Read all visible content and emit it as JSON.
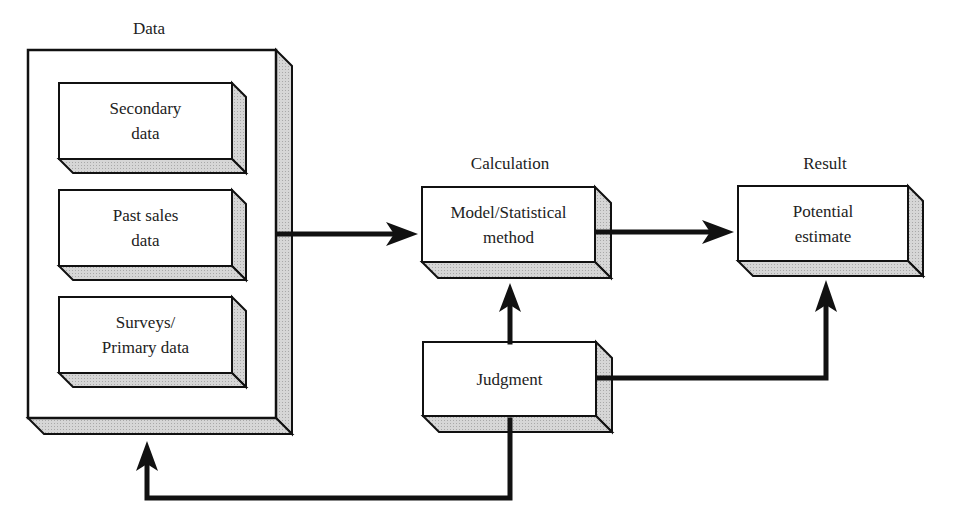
{
  "caption_fragment": "g",
  "colors": {
    "line": "#111111",
    "box_fill": "#ffffff",
    "shade": "#cfcfcf"
  },
  "diagram": {
    "data_group": {
      "label": "Data",
      "items": [
        {
          "text": "Secondary\ndata"
        },
        {
          "text": "Past sales\ndata"
        },
        {
          "text": "Surveys/\nPrimary data"
        }
      ]
    },
    "calculation": {
      "label": "Calculation",
      "box_text": "Model/Statistical\nmethod"
    },
    "result": {
      "label": "Result",
      "box_text": "Potential\nestimate"
    },
    "judgment": {
      "box_text": "Judgment"
    },
    "connections": [
      {
        "from": "Data",
        "to": "Model/Statistical method"
      },
      {
        "from": "Model/Statistical method",
        "to": "Potential estimate"
      },
      {
        "from": "Judgment",
        "to": "Model/Statistical method"
      },
      {
        "from": "Judgment",
        "to": "Potential estimate"
      },
      {
        "from": "Judgment",
        "to": "Data"
      }
    ]
  }
}
